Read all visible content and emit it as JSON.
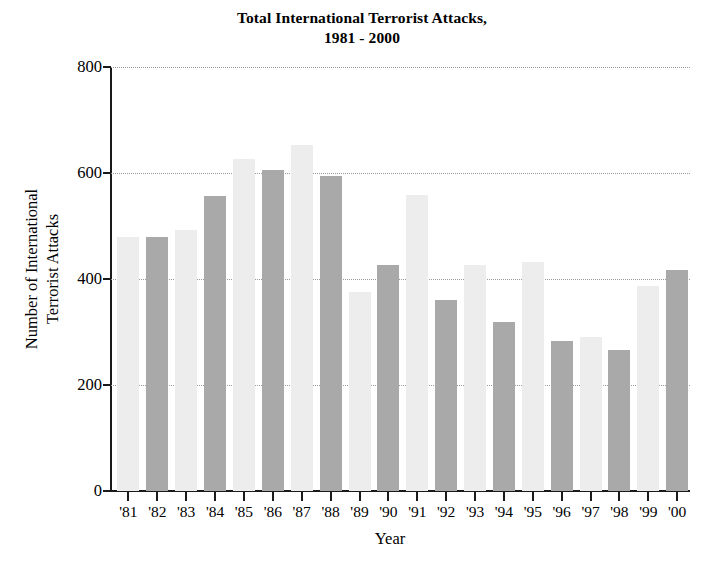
{
  "chart_data": {
    "type": "bar",
    "title": "Total International Terrorist Attacks,",
    "subtitle": "1981 - 2000",
    "xlabel": "Year",
    "ylabel_line1": "Number of International",
    "ylabel_line2": "Terrorist Attacks",
    "categories": [
      "'81",
      "'82",
      "'83",
      "'84",
      "'85",
      "'86",
      "'87",
      "'88",
      "'89",
      "'90",
      "'91",
      "'92",
      "'93",
      "'94",
      "'95",
      "'96",
      "'97",
      "'98",
      "'99",
      "'00"
    ],
    "values": [
      480,
      480,
      492,
      556,
      627,
      605,
      652,
      594,
      375,
      427,
      558,
      360,
      427,
      318,
      433,
      283,
      290,
      266,
      386,
      417
    ],
    "ylim": [
      0,
      800
    ],
    "yticks": [
      0,
      200,
      400,
      600,
      800
    ],
    "ytick_labels": [
      "0",
      "200",
      "400",
      "600",
      "800"
    ],
    "grid": "horizontal-dotted",
    "legend": "none",
    "bar_colors": [
      "#ededed",
      "#a9a9a9"
    ],
    "axis_color": "#1a1a1a",
    "grid_color": "#9a9a9a",
    "background": "#ffffff"
  }
}
